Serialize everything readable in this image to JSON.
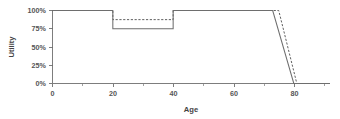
{
  "chart_data": {
    "type": "line",
    "title": "",
    "subtitle": "",
    "xlabel": "Age",
    "ylabel": "Utility",
    "xlim": [
      0,
      92
    ],
    "ylim": [
      0,
      1.0
    ],
    "grid": false,
    "legend_position": "none",
    "x_ticks": [
      0,
      20,
      40,
      60,
      80
    ],
    "x_tick_labels": [
      "0",
      "20",
      "40",
      "60",
      "80"
    ],
    "x_minor_ticks": [
      10,
      30,
      50,
      70,
      90
    ],
    "y_ticks": [
      0,
      0.25,
      0.5,
      0.75,
      1.0
    ],
    "y_tick_labels": [
      "0%",
      "25%",
      "50%",
      "75%",
      "100%"
    ],
    "annotations": [],
    "series": [
      {
        "name": "solid",
        "style": "solid",
        "color": "#6e6e6e",
        "x": [
          0,
          20,
          20,
          40,
          40,
          73,
          80,
          92
        ],
        "values": [
          1.0,
          1.0,
          0.75,
          0.75,
          1.0,
          1.0,
          0.0,
          0.0
        ]
      },
      {
        "name": "dashed",
        "style": "dashed",
        "color": "#5f5f5f",
        "x": [
          0,
          20,
          20,
          40,
          40,
          75,
          81,
          92
        ],
        "values": [
          1.0,
          1.0,
          0.875,
          0.875,
          1.0,
          1.0,
          0.0,
          0.0
        ]
      }
    ]
  },
  "axes": {
    "y_title": "Utility",
    "x_title": "Age"
  }
}
